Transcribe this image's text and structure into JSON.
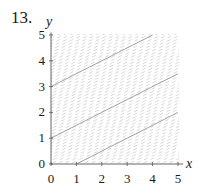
{
  "problem": {
    "number": "13."
  },
  "chart_data": {
    "type": "slope-field",
    "title": "",
    "xlabel": "x",
    "ylabel": "y",
    "xlim": [
      0,
      5
    ],
    "ylim": [
      0,
      5
    ],
    "x_ticks": [
      "0",
      "1",
      "2",
      "3",
      "4",
      "5"
    ],
    "y_ticks": [
      "0",
      "1",
      "2",
      "3",
      "4",
      "5"
    ],
    "slope": 0.5,
    "field_color": "#c8c8c8",
    "curve_color": "#9a9a9a",
    "solution_curves": [
      {
        "name": "through (0,3)",
        "points": [
          [
            0,
            3
          ],
          [
            4,
            5
          ]
        ]
      },
      {
        "name": "through (0,1)",
        "points": [
          [
            0,
            1
          ],
          [
            5,
            3.5
          ]
        ]
      },
      {
        "name": "through (1,0)",
        "points": [
          [
            1,
            0
          ],
          [
            5,
            2
          ]
        ]
      }
    ]
  }
}
